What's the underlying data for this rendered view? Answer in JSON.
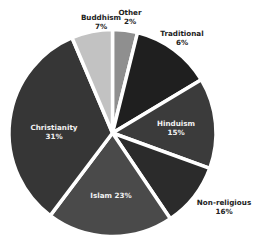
{
  "chart_data": {
    "type": "pie",
    "title": "",
    "start_angle_deg": 0,
    "direction": "clockwise",
    "exploded": true,
    "legend": "none",
    "slices": [
      {
        "label": "Other",
        "value": 2,
        "display": "2%",
        "color": "#8f8f8f",
        "visual_start": 0,
        "visual_end": 14,
        "label_pos": "outside"
      },
      {
        "label": "Traditional",
        "value": 6,
        "display": "6%",
        "color": "#1f1f1f",
        "visual_start": 14,
        "visual_end": 59,
        "label_pos": "outside"
      },
      {
        "label": "Hinduism",
        "value": 15,
        "display": "15%",
        "color": "#3b3b3b",
        "visual_start": 59,
        "visual_end": 110,
        "label_pos": "inside"
      },
      {
        "label": "Non-religious",
        "value": 16,
        "display": "16%",
        "color": "#2b2b2b",
        "visual_start": 110,
        "visual_end": 146,
        "label_pos": "outside"
      },
      {
        "label": "Islam",
        "value": 23,
        "display": "23%",
        "color": "#4a4a4a",
        "visual_start": 146,
        "visual_end": 217,
        "label_pos": "inside"
      },
      {
        "label": "Christianity",
        "value": 31,
        "display": "31%",
        "color": "#363636",
        "visual_start": 217,
        "visual_end": 337,
        "label_pos": "inside"
      },
      {
        "label": "Buddhism",
        "value": 7,
        "display": "7%",
        "color": "#c2c2c2",
        "visual_start": 337,
        "visual_end": 360,
        "label_pos": "outside"
      }
    ]
  },
  "labels": {
    "other": {
      "name": "Other",
      "pct": "2%"
    },
    "traditional": {
      "name": "Traditional",
      "pct": "6%"
    },
    "hinduism": {
      "name": "Hinduism",
      "pct": "15%"
    },
    "non_religious": {
      "name": "Non-religious",
      "pct": "16%"
    },
    "islam": {
      "name": "Islam",
      "pct": "23%",
      "combined": "Islam 23%"
    },
    "christianity": {
      "name": "Christianity",
      "pct": "31%"
    },
    "buddhism": {
      "name": "Buddhism",
      "pct": "7%"
    }
  }
}
